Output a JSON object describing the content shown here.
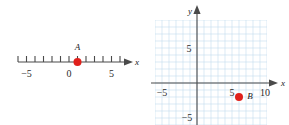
{
  "figure": {
    "caption": "",
    "point_color": "#e0201b",
    "axis_color": "#4a4a4a",
    "grid_color": "#bcd4ea",
    "grid_minor_color": "#d7e6f4",
    "background": "#ffffff"
  },
  "numberline": {
    "name": "number-line",
    "axis_label": "x",
    "min": -6,
    "max": 6,
    "tick_step": 1,
    "labeled_ticks": [
      {
        "value": -5,
        "text": "−5"
      },
      {
        "value": 0,
        "text": "0"
      },
      {
        "value": 5,
        "text": "5"
      }
    ],
    "points": [
      {
        "label": "A",
        "value": 1
      }
    ]
  },
  "coordinate_plane": {
    "name": "coordinate-plane",
    "x_axis_label": "x",
    "y_axis_label": "y",
    "xlim": [
      -6,
      10
    ],
    "ylim": [
      -6,
      9
    ],
    "grid": true,
    "grid_step": 1,
    "x_labeled_ticks": [
      {
        "value": -5,
        "text": "−5"
      },
      {
        "value": 5,
        "text": "5"
      },
      {
        "value": 10,
        "text": "10"
      }
    ],
    "y_labeled_ticks": [
      {
        "value": 5,
        "text": "5"
      },
      {
        "value": -5,
        "text": "−5"
      }
    ],
    "points": [
      {
        "label": "B",
        "x": 6,
        "y": -2
      }
    ]
  }
}
